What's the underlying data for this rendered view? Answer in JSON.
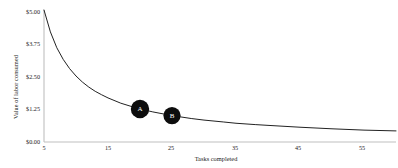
{
  "chart_data": {
    "type": "line",
    "title": "",
    "xlabel": "Tasks completed",
    "ylabel": "Value of labor consumed",
    "xlim": [
      5,
      60
    ],
    "ylim": [
      0,
      5
    ],
    "xticks": [
      5,
      15,
      25,
      35,
      45,
      55
    ],
    "xticklabels": [
      "5",
      "15",
      "25",
      "35",
      "45",
      "55"
    ],
    "yticks": [
      0,
      1.25,
      2.5,
      3.75,
      5
    ],
    "yticklabels": [
      "$0.00",
      "$1.25",
      "$2.50",
      "$3.75",
      "$5.00"
    ],
    "grid": false,
    "legend": null,
    "line_color": "#222222",
    "marker_color": "#0d0d0d",
    "marker_text_color": "#ffffff",
    "axis_color": "#bfbfbf",
    "series": [
      {
        "name": "Value of labor consumed",
        "x": [
          5,
          6,
          7,
          8,
          9,
          10,
          11,
          12,
          13,
          14,
          15,
          17,
          19,
          20,
          22,
          25,
          28,
          30,
          33,
          35,
          38,
          40,
          45,
          50,
          55,
          60
        ],
        "values": [
          5.0,
          4.17,
          3.57,
          3.13,
          2.78,
          2.5,
          2.27,
          2.08,
          1.92,
          1.79,
          1.67,
          1.47,
          1.32,
          1.25,
          1.14,
          1.0,
          0.89,
          0.83,
          0.76,
          0.71,
          0.66,
          0.63,
          0.56,
          0.5,
          0.45,
          0.42
        ]
      }
    ],
    "annotations": [
      {
        "label": "A",
        "x": 20,
        "y": 1.25
      },
      {
        "label": "B",
        "x": 25,
        "y": 1.0
      }
    ]
  },
  "axes": {
    "y_title": "Value of labor consumed",
    "x_title": "Tasks completed",
    "y_labels": {
      "t0": "$5.00",
      "t1": "$3.75",
      "t2": "$2.50",
      "t3": "$1.25",
      "t4": "$0.00"
    },
    "x_labels": {
      "t0": "5",
      "t1": "15",
      "t2": "25",
      "t3": "35",
      "t4": "45",
      "t5": "55"
    }
  },
  "markers": {
    "a": "A",
    "b": "B"
  }
}
